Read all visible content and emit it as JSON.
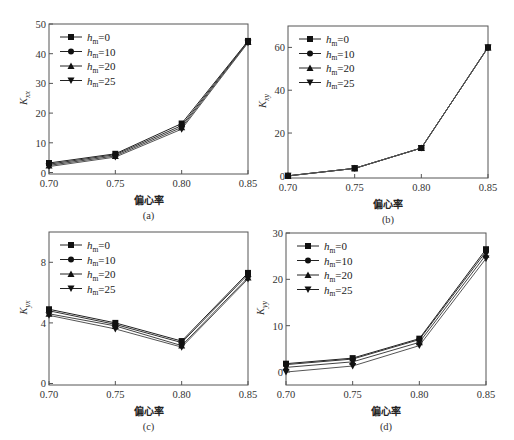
{
  "figure": {
    "xlabel": "偏心率",
    "legend": [
      {
        "label": "h",
        "sub": "m",
        "value": "=0",
        "marker": "square"
      },
      {
        "label": "h",
        "sub": "m",
        "value": "=10",
        "marker": "circle"
      },
      {
        "label": "h",
        "sub": "m",
        "value": "=20",
        "marker": "triangle-up"
      },
      {
        "label": "h",
        "sub": "m",
        "value": "=25",
        "marker": "triangle-down"
      }
    ]
  },
  "chart_data": [
    {
      "type": "line",
      "panel": "(a)",
      "title": "",
      "xlabel": "偏心率",
      "ylabel": "K_xx",
      "x": [
        0.7,
        0.75,
        0.8,
        0.85
      ],
      "xticks": [
        "0.70",
        "0.75",
        "0.80",
        "0.85"
      ],
      "yticks": [
        0,
        10,
        20,
        30,
        40,
        50
      ],
      "ylim": [
        -0.5,
        50
      ],
      "legend_position": "upper left",
      "series": [
        {
          "name": "h_m=0",
          "values": [
            3.2,
            6.3,
            16.5,
            44.3
          ]
        },
        {
          "name": "h_m=10",
          "values": [
            2.8,
            6.0,
            15.8,
            44.1
          ]
        },
        {
          "name": "h_m=20",
          "values": [
            2.4,
            5.6,
            15.2,
            43.9
          ]
        },
        {
          "name": "h_m=25",
          "values": [
            2.0,
            5.2,
            14.6,
            43.7
          ]
        }
      ]
    },
    {
      "type": "line",
      "panel": "(b)",
      "title": "",
      "xlabel": "偏心率",
      "ylabel": "K_xy",
      "x": [
        0.7,
        0.75,
        0.8,
        0.85
      ],
      "xticks": [
        "0.70",
        "0.75",
        "0.80",
        "0.85"
      ],
      "yticks": [
        0,
        20,
        40,
        60
      ],
      "ylim": [
        -1,
        70
      ],
      "legend_position": "upper left",
      "series": [
        {
          "name": "h_m=0",
          "values": [
            0.0,
            3.5,
            13.0,
            60.0
          ]
        },
        {
          "name": "h_m=10",
          "values": [
            0.0,
            3.5,
            13.0,
            60.0
          ]
        },
        {
          "name": "h_m=20",
          "values": [
            0.0,
            3.5,
            13.0,
            60.0
          ]
        },
        {
          "name": "h_m=25",
          "values": [
            0.0,
            3.5,
            13.0,
            60.0
          ]
        }
      ]
    },
    {
      "type": "line",
      "panel": "(c)",
      "title": "",
      "xlabel": "偏心率",
      "ylabel": "K_yx",
      "x": [
        0.7,
        0.75,
        0.8,
        0.85
      ],
      "xticks": [
        "0.70",
        "0.75",
        "0.80",
        "0.85"
      ],
      "yticks": [
        0,
        4,
        8
      ],
      "ylim": [
        -0.1,
        10
      ],
      "legend_position": "upper left",
      "series": [
        {
          "name": "h_m=0",
          "values": [
            4.9,
            4.0,
            2.8,
            7.3
          ]
        },
        {
          "name": "h_m=10",
          "values": [
            4.8,
            3.9,
            2.7,
            7.2
          ]
        },
        {
          "name": "h_m=20",
          "values": [
            4.6,
            3.8,
            2.5,
            7.0
          ]
        },
        {
          "name": "h_m=25",
          "values": [
            4.5,
            3.6,
            2.4,
            6.9
          ]
        }
      ]
    },
    {
      "type": "line",
      "panel": "(d)",
      "title": "",
      "xlabel": "偏心率",
      "ylabel": "K_yy",
      "x": [
        0.7,
        0.75,
        0.8,
        0.85
      ],
      "xticks": [
        "0.70",
        "0.75",
        "0.80",
        "0.85"
      ],
      "yticks": [
        0,
        10,
        20,
        30
      ],
      "ylim": [
        -2.8,
        30
      ],
      "legend_position": "upper left",
      "series": [
        {
          "name": "h_m=0",
          "values": [
            1.8,
            3.0,
            7.2,
            26.5
          ]
        },
        {
          "name": "h_m=10",
          "values": [
            1.6,
            2.8,
            7.0,
            26.0
          ]
        },
        {
          "name": "h_m=20",
          "values": [
            1.0,
            2.2,
            6.4,
            25.3
          ]
        },
        {
          "name": "h_m=25",
          "values": [
            0.0,
            1.3,
            5.7,
            24.5
          ]
        }
      ]
    }
  ],
  "layout": [
    {
      "left": 49,
      "top": 24,
      "right": 248,
      "bottom": 174,
      "ox": 0,
      "oy": 0,
      "ylabel_main": "K",
      "ylabel_sub": "xx",
      "caption": "(a)"
    },
    {
      "left": 288,
      "top": 26,
      "right": 488,
      "bottom": 178,
      "ox": 0,
      "oy": 0,
      "ylabel_main": "K",
      "ylabel_sub": "xy",
      "caption": "(b)"
    },
    {
      "left": 49,
      "top": 232,
      "right": 248,
      "bottom": 385,
      "ox": 0,
      "oy": 0,
      "ylabel_main": "K",
      "ylabel_sub": "yx",
      "caption": "(c)"
    },
    {
      "left": 286,
      "top": 233,
      "right": 486,
      "bottom": 385,
      "ox": 0,
      "oy": 0,
      "ylabel_main": "K",
      "ylabel_sub": "yy",
      "caption": "(d)"
    }
  ],
  "colors": {
    "axis": "#555555",
    "lines": [
      "#222222",
      "#333333",
      "#444444",
      "#555555"
    ],
    "markers": "#111111"
  }
}
